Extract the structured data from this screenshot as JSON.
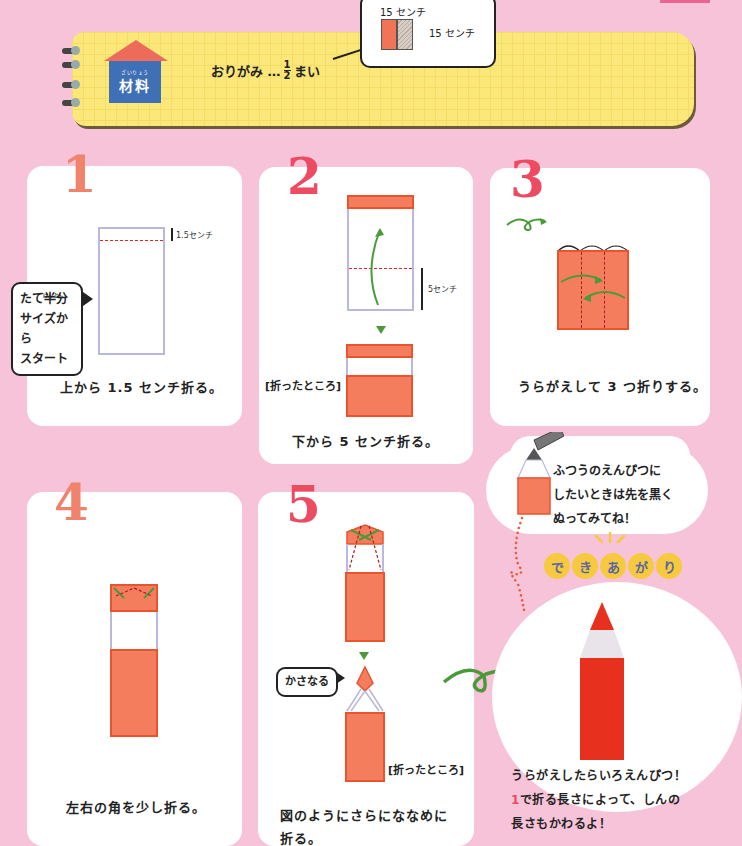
{
  "materials": {
    "title_ruby": "ざいりょう",
    "title": "材料",
    "item_prefix": "おりがみ …",
    "fraction_numerator": "1",
    "fraction_denominator": "2",
    "item_suffix": "まい",
    "dimension_width": "15 センチ",
    "dimension_height": "15 センチ"
  },
  "steps": [
    {
      "number": "1",
      "measure_label": "1.5センチ",
      "bubble_ruby": "はんぶん",
      "bubble_lines": [
        "たて半分",
        "サイズから",
        "スタート"
      ],
      "caption_ruby": [
        "うえ",
        "お"
      ],
      "caption": "上から 1.5 センチ折る。"
    },
    {
      "number": "2",
      "measure_label": "5センチ",
      "folded_label": "[折ったところ]",
      "caption_ruby": [
        "した",
        "お"
      ],
      "caption": "下から 5 センチ折る。"
    },
    {
      "number": "3",
      "caption": "うらがえして 3 つ折りする。"
    },
    {
      "number": "4",
      "caption_ruby": [
        "さ ゆう",
        "かど",
        "すこ",
        "お"
      ],
      "caption": "左右の角を少し折る。"
    },
    {
      "number": "5",
      "bubble": "かさなる",
      "folded_label": "[折ったところ]",
      "caption_line1": "図のようにさらにななめに",
      "caption_line2": "折る。"
    }
  ],
  "tip": {
    "lines": [
      "ふつうのえんぴつに",
      "したいときは先を黒く",
      "ぬってみてね！"
    ]
  },
  "finished": {
    "label_chars": [
      "で",
      "き",
      "あ",
      "が",
      "り"
    ],
    "line1": "うらがえしたらいろえんぴつ！",
    "line2_highlight": "1",
    "line2": "で折る長さによって、しんの",
    "line3": "長さもかわるよ！"
  },
  "colors": {
    "background": "#f7c3d8",
    "paper_orange": "#f47d5d",
    "fold_red": "#d8262f",
    "arrow_green": "#4a9a3a",
    "banner_yellow": "#fbe77a",
    "house_blue": "#3f6fb4",
    "pencil_red": "#e8301e"
  }
}
